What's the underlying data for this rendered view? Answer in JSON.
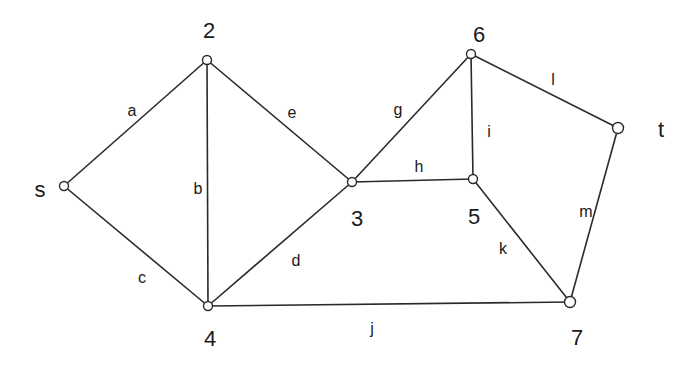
{
  "graph": {
    "nodes": [
      {
        "id": "s",
        "label": "s",
        "x": 64,
        "y": 186,
        "lx": 40,
        "ly": 191
      },
      {
        "id": "2",
        "label": "2",
        "x": 207,
        "y": 60,
        "lx": 209,
        "ly": 32
      },
      {
        "id": "3",
        "label": "3",
        "x": 352,
        "y": 182,
        "lx": 357,
        "ly": 220
      },
      {
        "id": "4",
        "label": "4",
        "x": 208,
        "y": 306,
        "lx": 210,
        "ly": 340
      },
      {
        "id": "5",
        "label": "5",
        "x": 473,
        "y": 179,
        "lx": 474,
        "ly": 218
      },
      {
        "id": "6",
        "label": "6",
        "x": 471,
        "y": 54,
        "lx": 479,
        "ly": 36
      },
      {
        "id": "t",
        "label": "t",
        "x": 618,
        "y": 128,
        "lx": 661,
        "ly": 131
      },
      {
        "id": "7",
        "label": "7",
        "x": 570,
        "y": 302,
        "lx": 577,
        "ly": 339
      }
    ],
    "edges": [
      {
        "label": "a",
        "from": "s",
        "to": "2",
        "lx": 132,
        "ly": 112
      },
      {
        "label": "b",
        "from": "2",
        "to": "4",
        "lx": 198,
        "ly": 190
      },
      {
        "label": "c",
        "from": "s",
        "to": "4",
        "lx": 142,
        "ly": 279
      },
      {
        "label": "d",
        "from": "4",
        "to": "3",
        "lx": 296,
        "ly": 262
      },
      {
        "label": "e",
        "from": "2",
        "to": "3",
        "lx": 292,
        "ly": 114
      },
      {
        "label": "g",
        "from": "3",
        "to": "6",
        "lx": 398,
        "ly": 111
      },
      {
        "label": "h",
        "from": "3",
        "to": "5",
        "lx": 419,
        "ly": 168
      },
      {
        "label": "i",
        "from": "6",
        "to": "5",
        "lx": 489,
        "ly": 133
      },
      {
        "label": "l",
        "from": "6",
        "to": "t",
        "lx": 553,
        "ly": 81
      },
      {
        "label": "m",
        "from": "t",
        "to": "7",
        "lx": 586,
        "ly": 213
      },
      {
        "label": "k",
        "from": "5",
        "to": "7",
        "lx": 503,
        "ly": 250
      },
      {
        "label": "j",
        "from": "4",
        "to": "7",
        "lx": 372,
        "ly": 330
      }
    ]
  }
}
